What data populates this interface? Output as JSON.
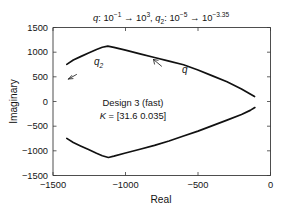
{
  "chart_data": {
    "type": "line",
    "title_parts": {
      "q_name": "q",
      "q_sep": ":",
      "q_from_base": "10",
      "q_from_exp": "−1",
      "q_arrow": "→",
      "q_to_base": "10",
      "q_to_exp": "3",
      "comma": ",",
      "q2_name": "q",
      "q2_sub": "2",
      "q2_sep": ":",
      "q2_from_base": "10",
      "q2_from_exp": "−5",
      "q2_arrow": "→",
      "q2_to_base": "10",
      "q2_to_exp": "−3.35"
    },
    "xlabel": "Real",
    "ylabel": "Imaginary",
    "xlim": [
      -1500,
      0
    ],
    "ylim": [
      -1500,
      1500
    ],
    "xticks": [
      -1500,
      -1000,
      -500,
      0
    ],
    "xticklabels": [
      "−1500",
      "−1000",
      "−500",
      "0"
    ],
    "yticks": [
      -1500,
      -1000,
      -500,
      0,
      500,
      1000,
      1500
    ],
    "yticklabels": [
      "−1500",
      "−1000",
      "−500",
      "0",
      "500",
      "1000",
      "1500"
    ],
    "grid": false,
    "legend": "none",
    "line_color": "#111111",
    "axis_color": "#3a3a3a",
    "background": "#ffffff",
    "series": [
      {
        "name": "upper-branch",
        "points": [
          [
            -1405,
            752
          ],
          [
            -1360,
            840
          ],
          [
            -1310,
            910
          ],
          [
            -1255,
            985
          ],
          [
            -1200,
            1055
          ],
          [
            -1160,
            1100
          ],
          [
            -1122,
            1122
          ],
          [
            -1080,
            1098
          ],
          [
            -1000,
            1040
          ],
          [
            -900,
            966
          ],
          [
            -800,
            892
          ],
          [
            -700,
            818
          ],
          [
            -600,
            744
          ],
          [
            -500,
            640
          ],
          [
            -400,
            520
          ],
          [
            -300,
            400
          ],
          [
            -200,
            255
          ],
          [
            -140,
            150
          ],
          [
            -110,
            100
          ]
        ]
      },
      {
        "name": "lower-branch",
        "points": [
          [
            -1405,
            -748
          ],
          [
            -1360,
            -830
          ],
          [
            -1310,
            -900
          ],
          [
            -1255,
            -975
          ],
          [
            -1200,
            -1050
          ],
          [
            -1160,
            -1100
          ],
          [
            -1118,
            -1135
          ],
          [
            -1080,
            -1108
          ],
          [
            -1000,
            -1045
          ],
          [
            -900,
            -968
          ],
          [
            -800,
            -890
          ],
          [
            -700,
            -800
          ],
          [
            -600,
            -700
          ],
          [
            -500,
            -600
          ],
          [
            -400,
            -490
          ],
          [
            -300,
            -378
          ],
          [
            -200,
            -262
          ],
          [
            -140,
            -180
          ],
          [
            -108,
            -122
          ]
        ]
      }
    ],
    "annotations": [
      {
        "name": "design-label",
        "line1": "Design 3 (fast)",
        "line2_prefix": "K",
        "line2_rest": " = [31.6  0.035]",
        "x": -860,
        "y": 300
      },
      {
        "name": "q2-curve-tag",
        "label": "q",
        "sub": "2",
        "x": -1090,
        "y": 1000
      },
      {
        "name": "q-curve-tag",
        "label": "q",
        "x": -640,
        "y": 760
      }
    ],
    "direction_arrows": [
      {
        "name": "q2-direction-arrow",
        "x": -1290,
        "y": 870,
        "angle": 200
      },
      {
        "name": "q-direction-arrow",
        "x": -710,
        "y": 930,
        "angle": 200
      }
    ]
  }
}
